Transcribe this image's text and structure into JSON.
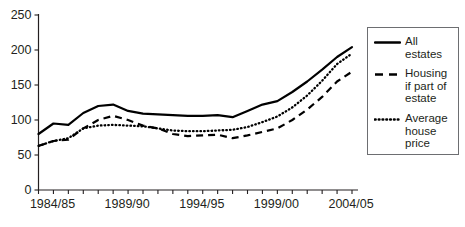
{
  "chart_data": {
    "type": "line",
    "title": "",
    "xlabel": "",
    "ylabel": "",
    "ylim": [
      0,
      250
    ],
    "yticks": [
      0,
      50,
      100,
      150,
      200,
      250
    ],
    "grid": false,
    "legend_position": "right",
    "x": [
      "1984/85",
      "1985/86",
      "1986/87",
      "1987/88",
      "1988/89",
      "1989/90",
      "1990/91",
      "1991/92",
      "1992/93",
      "1993/94",
      "1994/95",
      "1995/96",
      "1996/97",
      "1997/98",
      "1998/99",
      "1999/00",
      "2000/01",
      "2001/02",
      "2002/03",
      "2003/04",
      "2004/05",
      "2005/06"
    ],
    "xtick_labels": [
      "1984/85",
      "1989/90",
      "1994/95",
      "1999/00",
      "2004/05"
    ],
    "xtick_indices": [
      0,
      5,
      10,
      15,
      20
    ],
    "series": [
      {
        "name": "All estates",
        "style": "solid",
        "values": [
          80,
          95,
          93,
          110,
          120,
          122,
          113,
          109,
          108,
          107,
          106,
          106,
          107,
          104,
          113,
          122,
          127,
          140,
          155,
          172,
          190,
          204
        ]
      },
      {
        "name": "Housing if part of estate",
        "style": "dashed",
        "values": [
          63,
          70,
          72,
          88,
          100,
          106,
          100,
          92,
          88,
          80,
          77,
          78,
          79,
          74,
          78,
          83,
          88,
          100,
          115,
          133,
          155,
          169
        ]
      },
      {
        "name": "Average house price",
        "style": "dotted",
        "values": [
          63,
          70,
          74,
          88,
          92,
          93,
          92,
          91,
          88,
          85,
          84,
          84,
          85,
          86,
          90,
          97,
          105,
          118,
          135,
          156,
          180,
          195
        ]
      }
    ]
  },
  "legend": {
    "entries": [
      {
        "label": "All estates",
        "swatch": "solid-line-swatch"
      },
      {
        "label": "Housing if part of estate",
        "swatch": "dashed-line-swatch"
      },
      {
        "label": "Average house price",
        "swatch": "dotted-line-swatch"
      }
    ]
  },
  "colors": {
    "line": "#000000",
    "axis": "#231f20",
    "legend_border": "#6d6e71",
    "background": "#ffffff"
  }
}
